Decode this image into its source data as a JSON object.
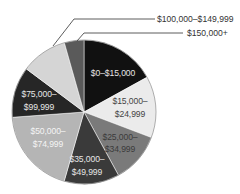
{
  "chart_data": {
    "type": "pie",
    "title": "",
    "start_angle_deg": 0,
    "direction": "clockwise",
    "legend": "none (direct labels + callouts)",
    "slices": [
      {
        "label": "$0–$15,000",
        "lines": [
          "$0–$15,000"
        ],
        "value": 17.0,
        "color": "#111111",
        "text_color": "#e6e6e6",
        "label_pos": "inside"
      },
      {
        "label": "$15,000–$24,999",
        "lines": [
          "$15,000–",
          "$24,999"
        ],
        "value": 13.8,
        "color": "#ebebeb",
        "text_color": "#444444",
        "label_pos": "inside"
      },
      {
        "label": "$25,000–$34,999",
        "lines": [
          "$25,000–",
          "$34,999"
        ],
        "value": 11.3,
        "color": "#7a7a7a",
        "text_color": "#3a3a3a",
        "label_pos": "inside"
      },
      {
        "label": "$35,000–$49,999",
        "lines": [
          "$35,000–",
          "$49,999"
        ],
        "value": 12.4,
        "color": "#3a3a3a",
        "text_color": "#e6e6e6",
        "label_pos": "inside"
      },
      {
        "label": "$50,000–$74,999",
        "lines": [
          "$50,000–",
          "$74,999"
        ],
        "value": 19.4,
        "color": "#b5b5b5",
        "text_color": "#f4f4f4",
        "label_pos": "inside"
      },
      {
        "label": "$75,000–$99,999",
        "lines": [
          "$75,000–",
          "$99,999"
        ],
        "value": 11.4,
        "color": "#262626",
        "text_color": "#e6e6e6",
        "label_pos": "inside"
      },
      {
        "label": "$100,000–$149,999",
        "lines": [
          "$100,000–$149,999"
        ],
        "value": 10.4,
        "color": "#d5d5d5",
        "text_color": "#333333",
        "label_pos": "callout"
      },
      {
        "label": "$150,000+",
        "lines": [
          "$150,000+"
        ],
        "value": 4.4,
        "color": "#5a5a5a",
        "text_color": "#333333",
        "label_pos": "callout"
      }
    ]
  },
  "labels": {
    "s0": [
      "$0–$15,000"
    ],
    "s1": [
      "$15,000–",
      "$24,999"
    ],
    "s2": [
      "$25,000–",
      "$34,999"
    ],
    "s3": [
      "$35,000–",
      "$49,999"
    ],
    "s4": [
      "$50,000–",
      "$74,999"
    ],
    "s5": [
      "$75,000–",
      "$99,999"
    ],
    "c6": "$100,000–$149,999",
    "c7": "$150,000+"
  }
}
